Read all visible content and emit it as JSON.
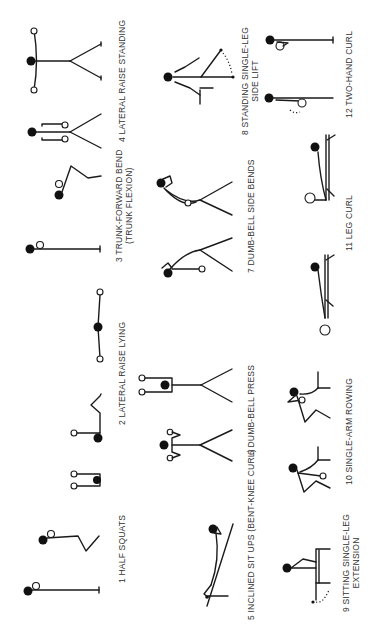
{
  "figure": {
    "orientation": "rotated-90-ccw",
    "exercises": [
      {
        "number": "1",
        "label": "HALF SQUATS",
        "line2": ""
      },
      {
        "number": "2",
        "label": "LATERAL RAISE LYING",
        "line2": ""
      },
      {
        "number": "3",
        "label": "TRUNK-FORWARD BEND",
        "line2": "(TRUNK FLEXION)"
      },
      {
        "number": "4",
        "label": "LATERAL RAISE STANDING",
        "line2": ""
      },
      {
        "number": "5",
        "label": "INCLINED SIT UPS (BENT-KNEE CURL)",
        "line2": ""
      },
      {
        "number": "6",
        "label": "DUMB-BELL PRESS",
        "line2": ""
      },
      {
        "number": "7",
        "label": "DUMB-BELL SIDE BENDS",
        "line2": ""
      },
      {
        "number": "8",
        "label": "STANDING SINGLE-LEG",
        "line2": "SIDE LIFT"
      },
      {
        "number": "9",
        "label": "SITTING SINGLE-LEG",
        "line2": "EXTENSION"
      },
      {
        "number": "10",
        "label": "SINGLE-ARM ROWING",
        "line2": ""
      },
      {
        "number": "11",
        "label": "LEG CURL",
        "line2": ""
      },
      {
        "number": "12",
        "label": "TWO-HAND CURL",
        "line2": ""
      }
    ]
  },
  "colors": {
    "background": "#ffffff",
    "ink": "#1a1a1a",
    "label": "#333333"
  }
}
